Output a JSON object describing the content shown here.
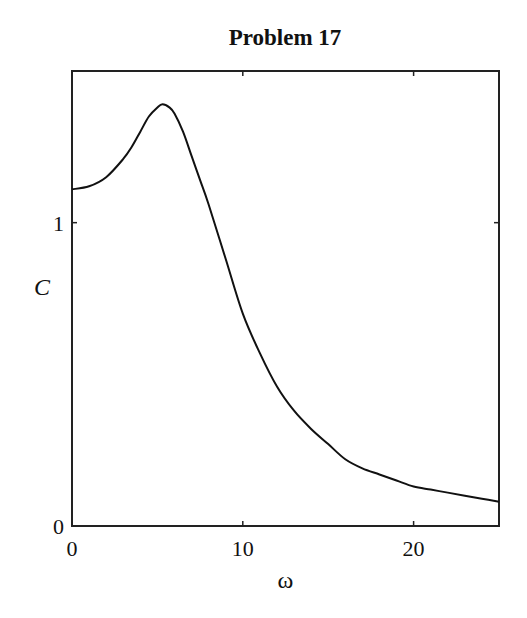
{
  "chart_data": {
    "type": "line",
    "title": "Problem 17",
    "xlabel": "ω",
    "ylabel": "C",
    "xlim": [
      0,
      25
    ],
    "ylim": [
      0,
      1.5
    ],
    "xticks": [
      0,
      10,
      20
    ],
    "xtick_labels": [
      "0",
      "10",
      "20"
    ],
    "yticks": [
      0,
      1
    ],
    "ytick_labels": [
      "0",
      "1"
    ],
    "grid": false,
    "legend": null,
    "series": [
      {
        "name": "C(ω)",
        "color": "#111111",
        "x": [
          0,
          1,
          2,
          3,
          3.5,
          4,
          4.5,
          5,
          5.3,
          5.7,
          6,
          6.5,
          7,
          7.5,
          8,
          9,
          10,
          11,
          12,
          13,
          14,
          15,
          16,
          17,
          18,
          19,
          20,
          21,
          22,
          23,
          24,
          25
        ],
        "y": [
          1.11,
          1.12,
          1.15,
          1.21,
          1.25,
          1.3,
          1.35,
          1.38,
          1.39,
          1.38,
          1.36,
          1.3,
          1.22,
          1.14,
          1.06,
          0.88,
          0.7,
          0.57,
          0.46,
          0.38,
          0.32,
          0.27,
          0.22,
          0.19,
          0.17,
          0.15,
          0.13,
          0.12,
          0.11,
          0.1,
          0.09,
          0.08
        ]
      }
    ]
  }
}
